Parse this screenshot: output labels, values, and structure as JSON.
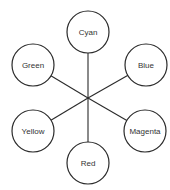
{
  "diagram": {
    "title": "",
    "hub": {
      "x": 88,
      "y": 98
    },
    "radius": 21,
    "nodes": [
      {
        "id": "cyan",
        "label": "Cyan",
        "x": 88,
        "y": 32
      },
      {
        "id": "blue",
        "label": "Blue",
        "x": 146,
        "y": 65
      },
      {
        "id": "magenta",
        "label": "Magenta",
        "x": 145,
        "y": 131
      },
      {
        "id": "red",
        "label": "Red",
        "x": 88,
        "y": 163
      },
      {
        "id": "yellow",
        "label": "Yellow",
        "x": 33,
        "y": 131
      },
      {
        "id": "green",
        "label": "Green",
        "x": 33,
        "y": 65
      }
    ],
    "colors": {
      "stroke": "#2a2a2a",
      "fill": "#ffffff",
      "text": "#333333"
    }
  }
}
